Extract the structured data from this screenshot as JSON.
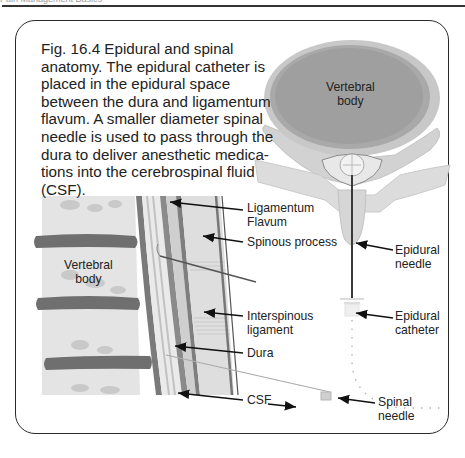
{
  "page": {
    "running_head": "Pain Management Basics"
  },
  "figure": {
    "caption": "Fig. 16.4 Epidural and spinal anatomy. The epidural catheter is placed in the epidural space between the dura and ligamentum flavum. A smaller diameter spinal needle is used to pass through the dura to deliver anesthetic medica-tions into the cerebrospinal fluid (CSF).",
    "caption_lines": [
      "Fig. 16.4 Epidural and spinal",
      "anatomy. The epidural catheter is",
      "placed in the epidural space",
      "between the dura and ligamentum",
      "flavum. A smaller diameter spinal",
      "needle is used to pass through the",
      "dura to deliver anesthetic medica-",
      "tions into the cerebrospinal fluid",
      "(CSF)."
    ],
    "labels": {
      "vertebral_body_axial": "Vertebral\nbody",
      "vertebral_body_sagittal": "Vertebral\nbody",
      "ligamentum_flavum": "Ligamentum\nFlavum",
      "spinous_process": "Spinous process",
      "epidural_needle": "Epidural\nneedle",
      "interspinous_ligament": "Interspinous\nligament",
      "epidural_catheter": "Epidural\ncatheter",
      "dura": "Dura",
      "csf": "CSF",
      "spinal_needle": "Spinal\nneedle"
    },
    "colors": {
      "bone_light": "#e6e6e6",
      "bone_mid": "#bdbdbd",
      "disc_dark": "#6f6f6f",
      "ink": "#222222",
      "frame": "#2a2a2a"
    }
  }
}
